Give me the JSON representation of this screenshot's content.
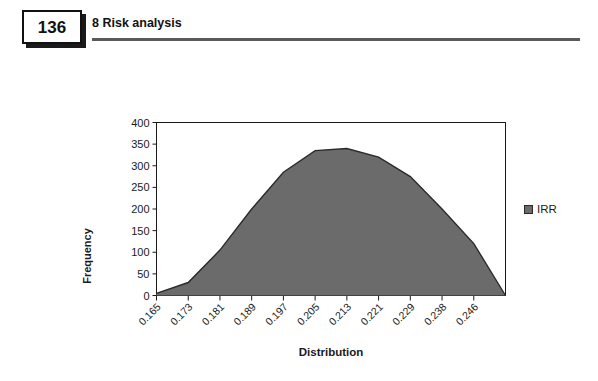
{
  "header": {
    "page_number": "136",
    "chapter_title": "8  Risk analysis"
  },
  "chart_data": {
    "type": "area",
    "title": "",
    "xlabel": "Distribution",
    "ylabel": "Frequency",
    "ylim": [
      0,
      400
    ],
    "ytick_values": [
      0,
      50,
      100,
      150,
      200,
      250,
      300,
      350,
      400
    ],
    "ytick_labels": [
      "0",
      "50",
      "100",
      "150",
      "200",
      "250",
      "300",
      "350",
      "400"
    ],
    "grid": false,
    "legend_position": "right",
    "series": [
      {
        "name": "IRR",
        "color": "#6b6b6b",
        "line_color": "#2b2b2b",
        "values": [
          5,
          30,
          105,
          200,
          285,
          335,
          340,
          320,
          275,
          200,
          120,
          0
        ]
      }
    ],
    "categories": [
      "0.165",
      "0.173",
      "0.181",
      "0.189",
      "0.197",
      "0.205",
      "0.213",
      "0.221",
      "0.229",
      "0.238",
      "0.246",
      ""
    ],
    "xtick_labels": [
      "0.165",
      "0.173",
      "0.181",
      "0.189",
      "0.197",
      "0.205",
      "0.213",
      "0.221",
      "0.229",
      "0.238",
      "0.246"
    ],
    "legend_entries": [
      "IRR"
    ]
  },
  "colors": {
    "series_fill": "#6b6b6b",
    "series_line": "#2b2b2b",
    "axis": "#1a1a1a",
    "rule": "#5a5a5a"
  }
}
